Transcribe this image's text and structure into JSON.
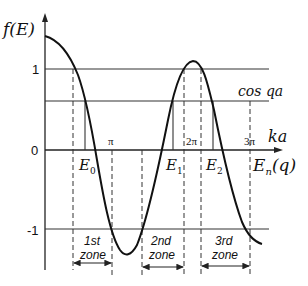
{
  "diagram": {
    "y_axis_label": "f(E)",
    "x_axis_label": "ka",
    "tick_labels": {
      "one": "1",
      "zero": "0",
      "minus_one": "-1",
      "pi": "π",
      "two_pi": "2π",
      "three_pi": "3π"
    },
    "line_labels": {
      "cos_qa": "cos qa",
      "energy_axis": "E",
      "energy_axis_sub": "n",
      "energy_axis_arg": "(q)"
    },
    "energy_levels": [
      {
        "label": "E",
        "sub": "0"
      },
      {
        "label": "E",
        "sub": "1"
      },
      {
        "label": "E",
        "sub": "2"
      }
    ],
    "zones": [
      {
        "line1": "1st",
        "line2": "zone"
      },
      {
        "line1": "2nd",
        "line2": "zone"
      },
      {
        "line1": "3rd",
        "line2": "zone"
      }
    ],
    "colors": {
      "line": "#222222",
      "curve": "#111111",
      "text": "#111111"
    }
  }
}
